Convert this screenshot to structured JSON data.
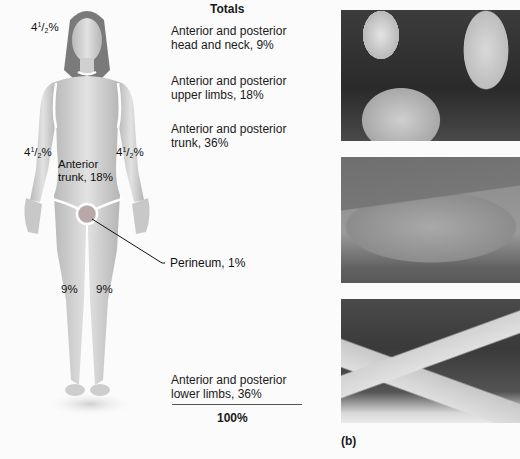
{
  "figure": {
    "region_labels": {
      "head": {
        "whole": "4",
        "num": "1",
        "den": "2",
        "suffix": "%"
      },
      "left_arm": {
        "whole": "4",
        "num": "1",
        "den": "2",
        "suffix": "%"
      },
      "right_arm": {
        "whole": "4",
        "num": "1",
        "den": "2",
        "suffix": "%"
      },
      "anterior_trunk_line1": "Anterior",
      "anterior_trunk_line2": "trunk, 18%",
      "left_leg": "9%",
      "right_leg": "9%"
    },
    "perineum_callout": "Perineum, 1%"
  },
  "totals": {
    "title": "Totals",
    "items": [
      {
        "line1": "Anterior and posterior",
        "line2": "head and neck, 9%"
      },
      {
        "line1": "Anterior and posterior",
        "line2": "upper limbs, 18%"
      },
      {
        "line1": "Anterior and posterior",
        "line2": "trunk, 36%"
      },
      {
        "line1": "Anterior and posterior",
        "line2": "lower limbs, 36%"
      }
    ],
    "grand_total": "100%"
  },
  "photos": {
    "panel_label": "(b)",
    "items": [
      {
        "subject": "children-sunburned-back"
      },
      {
        "subject": "burned-skin-closeup"
      },
      {
        "subject": "burned-legs"
      }
    ]
  },
  "colors": {
    "skin": "#d6d6d6",
    "outline": "#ffffff",
    "text": "#111111"
  }
}
